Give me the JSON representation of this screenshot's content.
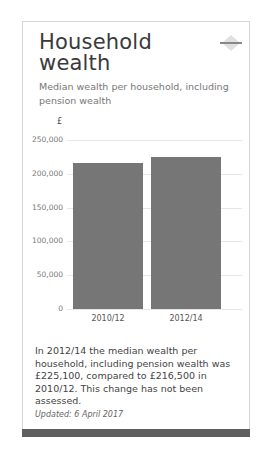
{
  "card": {
    "title": "Household wealth",
    "subtitle": "Median wealth per household, including pension wealth",
    "trend_icon": "no-change-diamond-icon",
    "description": "In 2012/14 the median wealth per household, including pension wealth was £225,100, compared to £216,500 in 2010/12. This change has not been assessed.",
    "updated": "Updated: 6 April 2017"
  },
  "colors": {
    "bar": "#767676",
    "footer_bar": "#5f5f5f",
    "title": "#3a3a3a"
  },
  "chart_data": {
    "type": "bar",
    "title": "Household wealth",
    "subtitle": "Median wealth per household, including pension wealth",
    "unit_label": "£",
    "categories": [
      "2010/12",
      "2012/14"
    ],
    "values": [
      216500,
      225100
    ],
    "xlabel": "",
    "ylabel": "£",
    "ylim": [
      0,
      250000
    ],
    "yticks": [
      0,
      50000,
      100000,
      150000,
      200000,
      250000
    ],
    "ytick_labels": [
      "0",
      "50,000",
      "100,000",
      "150,000",
      "200,000",
      "250,000"
    ],
    "grid": true,
    "legend": "none"
  }
}
